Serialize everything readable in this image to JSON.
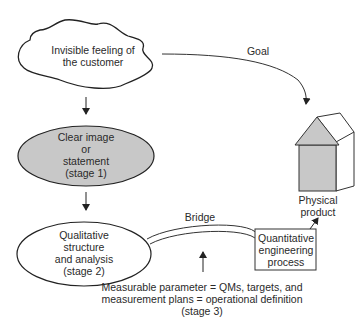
{
  "nodes": {
    "cloud": {
      "lines": [
        "Invisible feeling of",
        "the customer"
      ]
    },
    "stage1": {
      "lines": [
        "Clear image",
        "or",
        "statement",
        "(stage 1)"
      ],
      "fill": "#c8c8c8"
    },
    "stage2": {
      "lines": [
        "Qualitative",
        "structure",
        "and analysis",
        "(stage 2)"
      ],
      "fill": "#ffffff"
    },
    "quant": {
      "lines": [
        "Quantitative",
        "engineering",
        "process"
      ]
    },
    "product": {
      "lines": [
        "Physical",
        "product"
      ],
      "fill": "#c8c8c8"
    }
  },
  "edges": {
    "goal": {
      "label": "Goal"
    },
    "bridge": {
      "label": "Bridge"
    }
  },
  "annotation": {
    "lines": [
      "Measurable parameter = QMs, targets, and",
      "measurement plans = operational definition",
      "(stage 3)"
    ]
  }
}
